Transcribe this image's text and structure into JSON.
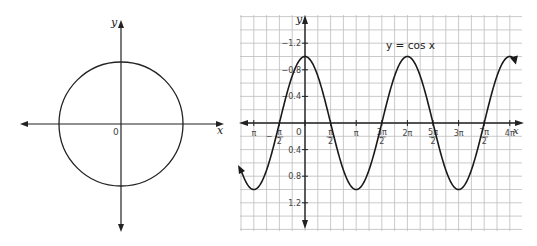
{
  "left_figure": {
    "type": "unit-circle",
    "x_label": "x",
    "y_label": "y",
    "origin_label": "0",
    "center": [
      121,
      124
    ],
    "radius": 62
  },
  "right_figure": {
    "equation_label": "y = cos x",
    "x_label": "x",
    "y_label": "y",
    "origin_label": "0",
    "y_ticks": [
      "1.2",
      "0.8",
      "0.4",
      "−0.4",
      "−0.8",
      "−1.2"
    ],
    "x_ticks": [
      "π",
      "−π/2",
      "π/2",
      "π",
      "3π/2",
      "2π",
      "5π/2",
      "3π",
      "7π/2",
      "4π"
    ]
  },
  "chart_data": {
    "type": "line",
    "title": "y = cos x",
    "xlabel": "x",
    "ylabel": "y",
    "x": [
      -1.25,
      -1.0,
      -0.5,
      0,
      0.5,
      1.0,
      1.5,
      2.0,
      2.5,
      3.0,
      3.5,
      4.0,
      4.1
    ],
    "x_units": "multiples of pi",
    "series": [
      {
        "name": "cos x",
        "values": [
          -0.71,
          -1,
          0,
          1,
          0,
          -1,
          0,
          1,
          0,
          -1,
          0,
          1,
          0.95
        ]
      }
    ],
    "xlim_pi": [
      -1.3,
      4.15
    ],
    "ylim": [
      -1.5,
      1.5
    ],
    "y_tick_values": [
      -1.2,
      -0.8,
      -0.4,
      0.4,
      0.8,
      1.2
    ],
    "grid": true,
    "legend": null
  }
}
